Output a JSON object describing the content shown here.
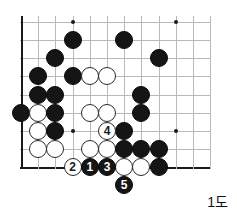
{
  "diagram": {
    "kind": "go-board-diagram",
    "caption": "1도",
    "board": {
      "origin_x": 21,
      "origin_y": 22,
      "step_x": 17.2,
      "step_y": 18.15,
      "cols": 12,
      "rows": 9,
      "stone_diameter": 18,
      "line_color": "#b9b9b9",
      "edge_color": "#1a1a1a",
      "black_color": "#151515",
      "white_color": "#ffffff"
    },
    "star_points": [
      {
        "col": 3,
        "row": 0
      },
      {
        "col": 9,
        "row": 0
      },
      {
        "col": 3,
        "row": 6
      },
      {
        "col": 9,
        "row": 6
      }
    ],
    "stones": [
      {
        "col": 3,
        "row": 1,
        "color": "black"
      },
      {
        "col": 6,
        "row": 1,
        "color": "black"
      },
      {
        "col": 2,
        "row": 2,
        "color": "black"
      },
      {
        "col": 8,
        "row": 2,
        "color": "black"
      },
      {
        "col": 1,
        "row": 3,
        "color": "black"
      },
      {
        "col": 3,
        "row": 3,
        "color": "black"
      },
      {
        "col": 4,
        "row": 3,
        "color": "white"
      },
      {
        "col": 5,
        "row": 3,
        "color": "white"
      },
      {
        "col": 1,
        "row": 4,
        "color": "black"
      },
      {
        "col": 2,
        "row": 4,
        "color": "black"
      },
      {
        "col": 7,
        "row": 4,
        "color": "black"
      },
      {
        "col": 0,
        "row": 5,
        "color": "black"
      },
      {
        "col": 1,
        "row": 5,
        "color": "white"
      },
      {
        "col": 2,
        "row": 5,
        "color": "black"
      },
      {
        "col": 4,
        "row": 5,
        "color": "white"
      },
      {
        "col": 5,
        "row": 5,
        "color": "white"
      },
      {
        "col": 7,
        "row": 5,
        "color": "black"
      },
      {
        "col": 1,
        "row": 6,
        "color": "white"
      },
      {
        "col": 2,
        "row": 6,
        "color": "black"
      },
      {
        "col": 6,
        "row": 6,
        "color": "black"
      },
      {
        "col": 1,
        "row": 7,
        "color": "white"
      },
      {
        "col": 2,
        "row": 7,
        "color": "white"
      },
      {
        "col": 4,
        "row": 7,
        "color": "white"
      },
      {
        "col": 5,
        "row": 7,
        "color": "white"
      },
      {
        "col": 6,
        "row": 7,
        "color": "black"
      },
      {
        "col": 7,
        "row": 7,
        "color": "black"
      },
      {
        "col": 8,
        "row": 7,
        "color": "black"
      },
      {
        "col": 6,
        "row": 8,
        "color": "white"
      },
      {
        "col": 7,
        "row": 8,
        "color": "white"
      },
      {
        "col": 8,
        "row": 8,
        "color": "black"
      }
    ],
    "numbered_moves": [
      {
        "label": "2",
        "col": 3,
        "row": 8,
        "color": "white"
      },
      {
        "label": "1",
        "col": 4,
        "row": 8,
        "color": "black"
      },
      {
        "label": "3",
        "col": 5,
        "row": 8,
        "color": "black"
      },
      {
        "label": "4",
        "col": 5,
        "row": 6,
        "color": "white"
      },
      {
        "label": "5",
        "col": 6,
        "row": 9,
        "color": "black"
      }
    ]
  }
}
